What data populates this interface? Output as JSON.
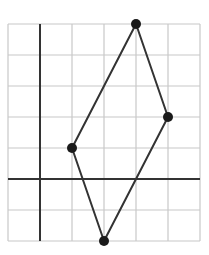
{
  "figure": {
    "type": "coordinate-grid",
    "grid": {
      "columns": 6,
      "rows": 7,
      "x_min": -1,
      "x_max": 5,
      "y_min": -2,
      "y_max": 5
    },
    "axes": {
      "x_axis_y": 0,
      "y_axis_x": 0
    },
    "shape": "quadrilateral (rhombus-like)",
    "points": [
      {
        "name": "top",
        "x": 3,
        "y": 5
      },
      {
        "name": "right",
        "x": 4,
        "y": 2
      },
      {
        "name": "bottom",
        "x": 2,
        "y": -2
      },
      {
        "name": "left",
        "x": 1,
        "y": 1
      }
    ],
    "colors": {
      "grid": "#c8c8c8",
      "axis": "#333333",
      "shape": "#333333",
      "point": "#1a1a1a"
    }
  }
}
